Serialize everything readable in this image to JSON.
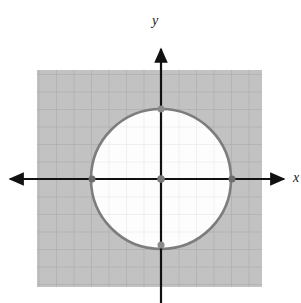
{
  "figure": {
    "kind": "cartesian-plane-with-shaded-exterior-of-circle",
    "width": 301,
    "height": 303,
    "background_color": "#ffffff"
  },
  "axes": {
    "x_axis": {
      "label": "x",
      "color": "#111111",
      "origin_px": {
        "x": 161,
        "y": 179
      },
      "start_px": {
        "x": 5,
        "y": 179
      },
      "end_px": {
        "x": 289,
        "y": 179
      },
      "arrowheads": "both"
    },
    "y_axis": {
      "label": "y",
      "color": "#111111",
      "origin_px": {
        "x": 161,
        "y": 179
      },
      "start_px": {
        "x": 161,
        "y": 303
      },
      "end_px": {
        "x": 161,
        "y": 45
      },
      "arrowheads": "top"
    }
  },
  "grid": {
    "spacing_px": 17.5,
    "outer_line_color": "#a8a8a8",
    "inner_line_color": "#e2e2e2",
    "visible": true
  },
  "shaded_region": {
    "description": "exterior of circle shaded gray",
    "fill_color": "#c2c2c2",
    "rect_px": {
      "x": 37,
      "y": 70,
      "width": 225,
      "height": 217
    }
  },
  "circle": {
    "center_px": {
      "x": 161,
      "y": 179
    },
    "radius_px": 70,
    "radius_units": 4,
    "center_units": {
      "x": 0,
      "y": 0
    },
    "stroke_color": "#7d7d7d",
    "stroke_width": 2.6,
    "interior_fill": "#fdfdfd",
    "boundary_style": "solid"
  },
  "points": [
    {
      "name": "center-point",
      "label": "(0, 0)",
      "cx": 161,
      "cy": 179,
      "r": 3.6,
      "color": "#7a7a7a"
    },
    {
      "name": "top-point",
      "label": "(0, 4)",
      "cx": 161,
      "cy": 109,
      "r": 3.4,
      "color": "#8a8a8a"
    },
    {
      "name": "bottom-point",
      "label": "(0, -4)",
      "cx": 161,
      "cy": 245,
      "r": 3.4,
      "color": "#8a8a8a"
    },
    {
      "name": "left-point",
      "label": "(-4, 0)",
      "cx": 92,
      "cy": 179,
      "r": 3.4,
      "color": "#6e6e6e"
    },
    {
      "name": "right-point",
      "label": "(4, 0)",
      "cx": 232,
      "cy": 179,
      "r": 3.4,
      "color": "#6e6e6e"
    }
  ],
  "colors": {
    "shade": "#c2c2c2",
    "circle_stroke": "#7d7d7d",
    "axis": "#111111",
    "point": "#7a7a7a",
    "white": "#ffffff"
  }
}
